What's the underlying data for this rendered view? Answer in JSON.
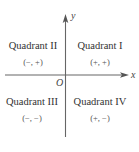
{
  "diagram": {
    "type": "coordinate-plane-quadrants",
    "axes": {
      "x_label": "x",
      "y_label": "y",
      "origin_label": "O"
    },
    "quadrants": [
      {
        "name": "Quadrant II",
        "signs": "(−, +)",
        "position": "top-left"
      },
      {
        "name": "Quadrant I",
        "signs": "(+, +)",
        "position": "top-right"
      },
      {
        "name": "Quadrant III",
        "signs": "(−, −)",
        "position": "bottom-left"
      },
      {
        "name": "Quadrant IV",
        "signs": "(+, −)",
        "position": "bottom-right"
      }
    ],
    "colors": {
      "axis": "#555555",
      "text": "#333333",
      "background": "#ffffff"
    }
  }
}
